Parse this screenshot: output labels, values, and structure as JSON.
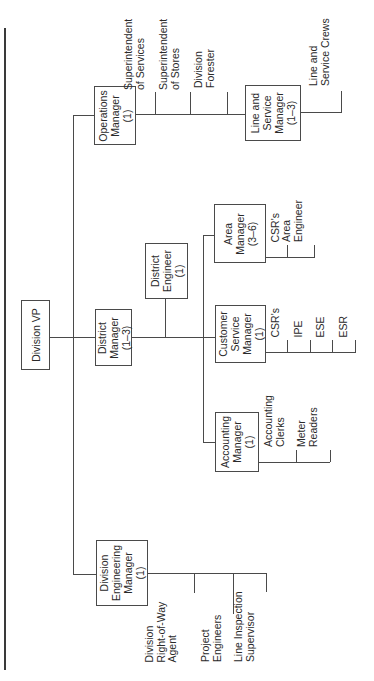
{
  "chart_title": "",
  "root": {
    "label": "Division VP"
  },
  "managers": {
    "operations": {
      "label": "Operations\nManager\n(1)"
    },
    "line_service": {
      "label": "Line and\nService\nManager\n(1–3)"
    },
    "district": {
      "label": "District\nManager\n(1–3)"
    },
    "district_engineer": {
      "label": "District\nEngineer\n(1)"
    },
    "area": {
      "label": "Area\nManager\n(3–6)"
    },
    "customer_service": {
      "label": "Customer\nService\nManager\n(1)"
    },
    "accounting": {
      "label": "Accounting\nManager\n(1)"
    },
    "division_engineering": {
      "label": "Division\nEngineering\nManager\n(1)"
    }
  },
  "reports": {
    "operations": [
      "Superintendent\nof Services",
      "Superintendent\nof Stores",
      "Division\nForester"
    ],
    "line_service": [
      "Line and\nService Crews"
    ],
    "area": [
      "CSR's",
      "Area\nEngineer"
    ],
    "customer_service": [
      "CSR's",
      "IPE",
      "ESE",
      "ESR"
    ],
    "accounting": [
      "Accounting\nClerks",
      "Meter\nReaders"
    ],
    "division_engineering": [
      "Division\nRight-of-Way\nAgent",
      "Project\nEngineers",
      "Line Inspection\nSupervisor"
    ]
  },
  "colors": {
    "line": "#4a4a4a",
    "text": "#2a2a2a",
    "background": "#ffffff"
  }
}
